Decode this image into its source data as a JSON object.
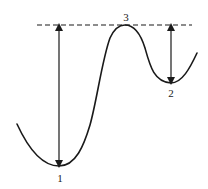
{
  "diagram": {
    "type": "energy-landscape",
    "colors": {
      "stroke": "#1a1a1a",
      "background": "#ffffff"
    },
    "reference_line": {
      "style": "dashed",
      "y": 25,
      "x_start": 37,
      "x_end": 192
    },
    "points": [
      {
        "label": "1",
        "x": 59,
        "y": 166,
        "kind": "global-minimum"
      },
      {
        "label": "2",
        "x": 171,
        "y": 83,
        "kind": "local-minimum"
      },
      {
        "label": "3",
        "x": 125,
        "y": 25,
        "kind": "maximum"
      }
    ],
    "arrows": [
      {
        "from_point": "1",
        "x": 59,
        "y_top": 25,
        "y_bottom": 166,
        "double_headed": true
      },
      {
        "from_point": "2",
        "x": 171,
        "y_top": 25,
        "y_bottom": 83,
        "double_headed": true
      }
    ],
    "labels": {
      "point1": "1",
      "point2": "2",
      "point3": "3"
    }
  }
}
